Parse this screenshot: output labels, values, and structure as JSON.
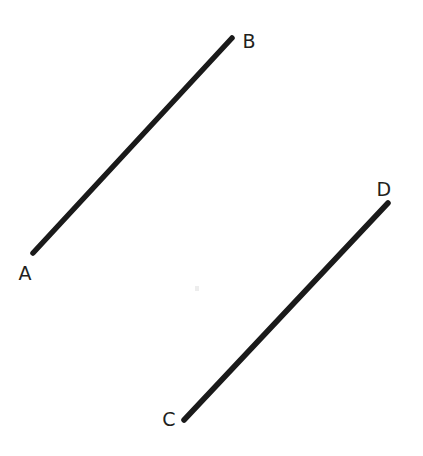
{
  "figure": {
    "width": 423,
    "height": 456,
    "background_color": "#ffffff",
    "stroke_color": "#1a1a1a",
    "stroke_width": 5.5,
    "label_color": "#231f20",
    "label_font_size": 19,
    "segments": [
      {
        "id": "AB",
        "start_label": "A",
        "end_label": "B",
        "x1": 33,
        "y1": 253,
        "x2": 232,
        "y2": 38
      },
      {
        "id": "CD",
        "start_label": "C",
        "end_label": "D",
        "x1": 184,
        "y1": 420,
        "x2": 388,
        "y2": 203
      }
    ],
    "labels": [
      {
        "text": "A",
        "x": 25,
        "y": 280,
        "anchor": "middle"
      },
      {
        "text": "B",
        "x": 249,
        "y": 48,
        "anchor": "middle"
      },
      {
        "text": "C",
        "x": 169,
        "y": 426,
        "anchor": "middle"
      },
      {
        "text": "D",
        "x": 384,
        "y": 196,
        "anchor": "middle"
      }
    ],
    "artifacts": [
      {
        "id": "scan-speck",
        "x": 195,
        "y": 286,
        "width": 4,
        "height": 5
      }
    ]
  },
  "chart_data": {
    "type": "scatter",
    "subtitle": "",
    "xlabel": "",
    "ylabel": "",
    "xlim": [
      0,
      423
    ],
    "ylim": [
      0,
      456
    ],
    "grid": false,
    "legend": "none",
    "note": "Pixel coordinates, y increases downward (image space).",
    "series": [
      {
        "name": "AB",
        "kind": "line-segment",
        "x": [
          33,
          232
        ],
        "y": [
          253,
          38
        ],
        "point_labels": [
          "A",
          "B"
        ],
        "length_px": 293,
        "slope": -1.08,
        "angle_deg": 47.2
      },
      {
        "name": "CD",
        "kind": "line-segment",
        "x": [
          184,
          388
        ],
        "y": [
          420,
          203
        ],
        "point_labels": [
          "C",
          "D"
        ],
        "length_px": 298,
        "slope": -1.06,
        "angle_deg": 46.8
      }
    ],
    "annotations": [
      {
        "text": "A",
        "x": 25,
        "y": 272
      },
      {
        "text": "B",
        "x": 249,
        "y": 40
      },
      {
        "text": "C",
        "x": 169,
        "y": 418
      },
      {
        "text": "D",
        "x": 384,
        "y": 187
      }
    ]
  }
}
